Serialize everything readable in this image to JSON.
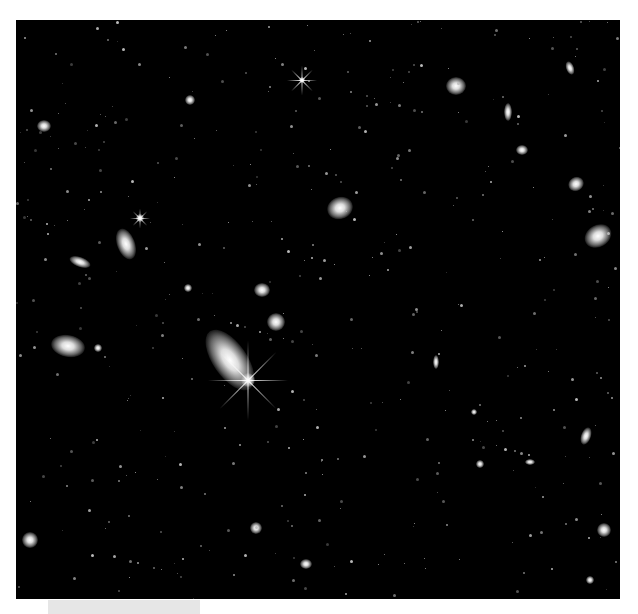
{
  "image": {
    "subject": "deep field of galaxies and stars",
    "background_color": "#000000",
    "border_color": "#ffffff"
  },
  "objects": [
    {
      "x": 230,
      "y": 360,
      "w": 34,
      "h": 70,
      "rot": -35
    },
    {
      "x": 248,
      "y": 380,
      "w": 14,
      "h": 14,
      "rot": 0
    },
    {
      "x": 340,
      "y": 208,
      "w": 26,
      "h": 22,
      "rot": -20
    },
    {
      "x": 598,
      "y": 236,
      "w": 28,
      "h": 22,
      "rot": -30
    },
    {
      "x": 126,
      "y": 244,
      "w": 18,
      "h": 32,
      "rot": -20
    },
    {
      "x": 68,
      "y": 346,
      "w": 34,
      "h": 22,
      "rot": 10
    },
    {
      "x": 276,
      "y": 322,
      "w": 18,
      "h": 18,
      "rot": 0
    },
    {
      "x": 262,
      "y": 290,
      "w": 16,
      "h": 14,
      "rot": 0
    },
    {
      "x": 456,
      "y": 86,
      "w": 20,
      "h": 18,
      "rot": 0
    },
    {
      "x": 576,
      "y": 184,
      "w": 16,
      "h": 14,
      "rot": -30
    },
    {
      "x": 80,
      "y": 262,
      "w": 22,
      "h": 10,
      "rot": 20
    },
    {
      "x": 44,
      "y": 126,
      "w": 14,
      "h": 12,
      "rot": 0
    },
    {
      "x": 522,
      "y": 150,
      "w": 12,
      "h": 10,
      "rot": 0
    },
    {
      "x": 508,
      "y": 112,
      "w": 8,
      "h": 18,
      "rot": 0
    },
    {
      "x": 570,
      "y": 68,
      "w": 8,
      "h": 14,
      "rot": -20
    },
    {
      "x": 586,
      "y": 436,
      "w": 10,
      "h": 18,
      "rot": 20
    },
    {
      "x": 436,
      "y": 362,
      "w": 6,
      "h": 14,
      "rot": 0
    },
    {
      "x": 30,
      "y": 540,
      "w": 16,
      "h": 16,
      "rot": 0
    },
    {
      "x": 604,
      "y": 530,
      "w": 14,
      "h": 14,
      "rot": 0
    },
    {
      "x": 256,
      "y": 528,
      "w": 12,
      "h": 12,
      "rot": 0
    },
    {
      "x": 306,
      "y": 564,
      "w": 12,
      "h": 10,
      "rot": 0
    },
    {
      "x": 190,
      "y": 100,
      "w": 10,
      "h": 10,
      "rot": 0
    },
    {
      "x": 302,
      "y": 80,
      "w": 6,
      "h": 6,
      "rot": 0
    },
    {
      "x": 140,
      "y": 218,
      "w": 8,
      "h": 8,
      "rot": 0
    },
    {
      "x": 188,
      "y": 288,
      "w": 8,
      "h": 8,
      "rot": 0
    },
    {
      "x": 98,
      "y": 348,
      "w": 8,
      "h": 8,
      "rot": 0
    },
    {
      "x": 480,
      "y": 464,
      "w": 8,
      "h": 8,
      "rot": 0
    },
    {
      "x": 530,
      "y": 462,
      "w": 10,
      "h": 6,
      "rot": 0
    },
    {
      "x": 474,
      "y": 412,
      "w": 6,
      "h": 6,
      "rot": 0
    },
    {
      "x": 590,
      "y": 580,
      "w": 8,
      "h": 8,
      "rot": 0
    }
  ],
  "stars": [
    {
      "x": 248,
      "y": 380,
      "len": 80
    },
    {
      "x": 302,
      "y": 80,
      "len": 30
    },
    {
      "x": 140,
      "y": 218,
      "len": 20
    }
  ]
}
